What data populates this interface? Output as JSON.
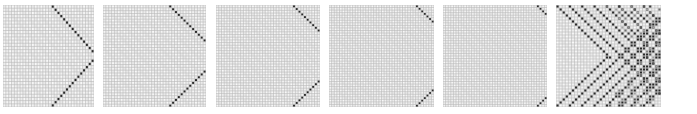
{
  "figure": {
    "background": "#ffffff",
    "grid_color": "#b8b8b8",
    "cell_fill": "#f2f2f2",
    "dot_color": "#2a2a2a",
    "panels": [
      {
        "id": "panel-1",
        "x": 3,
        "width": 91,
        "height": 102,
        "cells": 32,
        "pattern": "chevron",
        "chevron_span": 14
      },
      {
        "id": "panel-2",
        "x": 103,
        "width": 103,
        "height": 102,
        "cells": 36,
        "pattern": "chevron",
        "chevron_span": 12
      },
      {
        "id": "panel-3",
        "x": 216,
        "width": 104,
        "height": 102,
        "cells": 38,
        "pattern": "chevron",
        "chevron_span": 9
      },
      {
        "id": "panel-4",
        "x": 329,
        "width": 105,
        "height": 102,
        "cells": 40,
        "pattern": "chevron",
        "chevron_span": 6
      },
      {
        "id": "panel-5",
        "x": 443,
        "width": 104,
        "height": 102,
        "cells": 40,
        "pattern": "chevron",
        "chevron_span": 3
      },
      {
        "id": "panel-6",
        "x": 556,
        "width": 105,
        "height": 102,
        "cells": 34,
        "pattern": "multi-band",
        "bands": 8,
        "band_step": 4
      }
    ]
  }
}
